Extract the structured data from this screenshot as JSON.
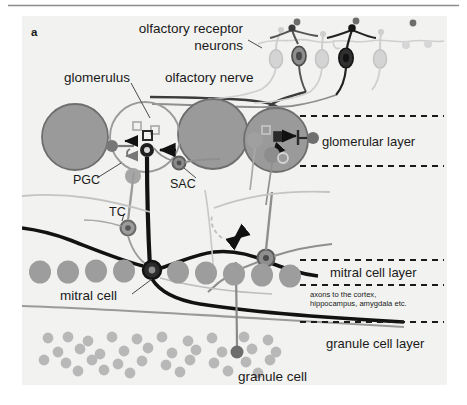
{
  "figure": {
    "panel_label": "a",
    "background_color": "#f2f2f0",
    "top_rule_color": "#8c8c8c",
    "ink_color": "#1a1a1a"
  },
  "labels": {
    "receptor_neurons_line1": "olfactory receptor",
    "receptor_neurons_line2": "neurons",
    "glomerulus": "glomerulus",
    "olfactory_nerve": "olfactory nerve",
    "pgc": "PGC",
    "sac": "SAC",
    "tc": "TC",
    "mitral_cell": "mitral cell",
    "granule_cell": "granule cell",
    "axons_line1": "axons to the cortex,",
    "axons_line2": "hippocampus, amygdala etc."
  },
  "layers": [
    {
      "name": "glomerular layer",
      "label": "glomerular layer"
    },
    {
      "name": "mitral cell layer",
      "label": "mitral cell layer"
    },
    {
      "name": "granule cell layer",
      "label": "granule cell layer"
    }
  ],
  "colors": {
    "glomerulus_fill": "#9a9a9a",
    "glomerulus_stroke": "#6e6e6e",
    "mitral_soma_fill": "#9d9d9d",
    "granule_dot_fill": "#b8b8b8",
    "neuron_light": "#cdcdcd",
    "neuron_mid": "#8f8f8f",
    "neuron_dark": "#333333",
    "dashed_line": "#1a1a1a",
    "thin_trace": "#8a8a8a"
  },
  "receptor_neurons": [
    {
      "shade": "light"
    },
    {
      "shade": "dark"
    },
    {
      "shade": "light"
    },
    {
      "shade": "darkest"
    },
    {
      "shade": "light"
    }
  ]
}
